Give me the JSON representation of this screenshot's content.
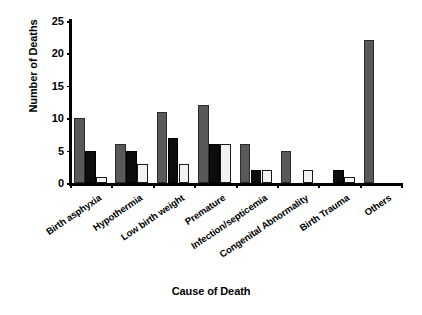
{
  "chart_data": {
    "type": "bar",
    "title": "",
    "xlabel": "Cause of Death",
    "ylabel": "Number of Deaths",
    "ylim": [
      0,
      25
    ],
    "yticks": [
      0,
      5,
      10,
      15,
      20,
      25
    ],
    "grid": false,
    "legend": "none",
    "categories": [
      "Birth asphyxia",
      "Hypothermia",
      "Low birth weight",
      "Premature",
      "Infection/septicemia",
      "Congenital Abnormality",
      "Birth Trauma",
      "Others"
    ],
    "series": [
      {
        "name": "series-1",
        "color": "#595959",
        "values": [
          10,
          6,
          11,
          12,
          6,
          5,
          0,
          22
        ]
      },
      {
        "name": "series-2",
        "color": "#0d0d0d",
        "values": [
          5,
          5,
          7,
          6,
          2,
          0,
          2,
          0
        ]
      },
      {
        "name": "series-3",
        "color": "#f2f2f2",
        "values": [
          1,
          3,
          3,
          6,
          2,
          2,
          1,
          0
        ]
      }
    ]
  }
}
